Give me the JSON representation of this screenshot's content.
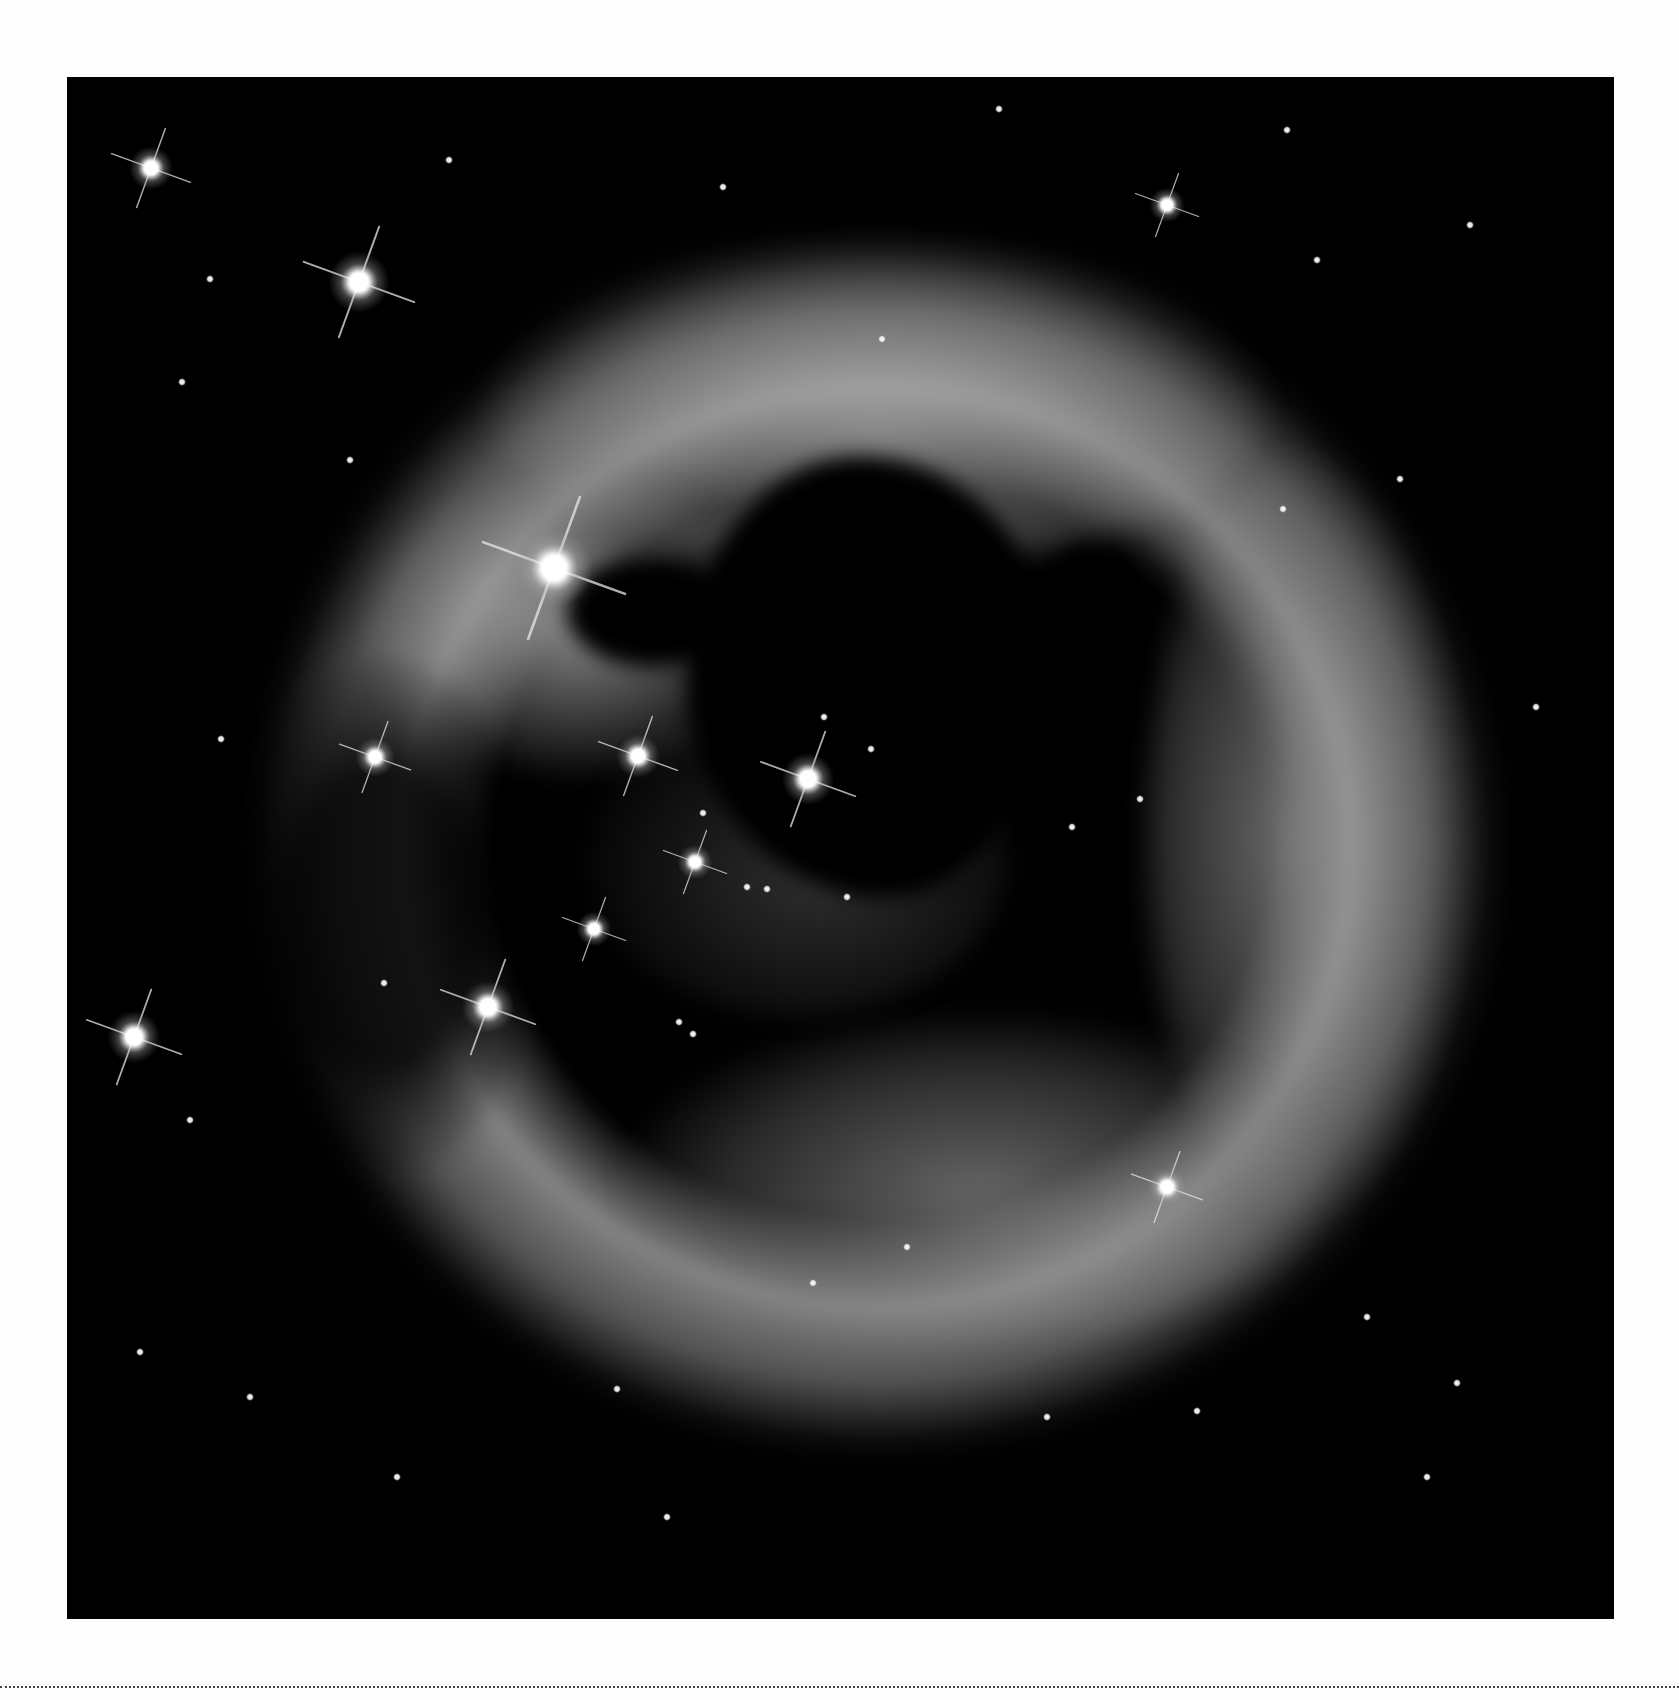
{
  "page": {
    "background_color": "#fdfdfd",
    "photo_background": "#000000",
    "rule_style": "dotted",
    "rule_color": "#444444"
  },
  "photo": {
    "subject": "light-echo nebula around a central star",
    "palette": "grayscale",
    "bright_stars": [
      {
        "x": 84,
        "y": 91,
        "r": 10
      },
      {
        "x": 292,
        "y": 205,
        "r": 14
      },
      {
        "x": 1100,
        "y": 128,
        "r": 8
      },
      {
        "x": 487,
        "y": 491,
        "r": 18
      },
      {
        "x": 571,
        "y": 679,
        "r": 10
      },
      {
        "x": 741,
        "y": 702,
        "r": 12
      },
      {
        "x": 308,
        "y": 680,
        "r": 9
      },
      {
        "x": 628,
        "y": 785,
        "r": 8
      },
      {
        "x": 527,
        "y": 852,
        "r": 8
      },
      {
        "x": 421,
        "y": 930,
        "r": 12
      },
      {
        "x": 67,
        "y": 960,
        "r": 12
      },
      {
        "x": 1100,
        "y": 1110,
        "r": 9
      }
    ],
    "faint_stars": [
      {
        "x": 143,
        "y": 202
      },
      {
        "x": 382,
        "y": 83
      },
      {
        "x": 656,
        "y": 110
      },
      {
        "x": 932,
        "y": 32
      },
      {
        "x": 1220,
        "y": 53
      },
      {
        "x": 1250,
        "y": 183
      },
      {
        "x": 1403,
        "y": 148
      },
      {
        "x": 115,
        "y": 305
      },
      {
        "x": 283,
        "y": 383
      },
      {
        "x": 815,
        "y": 262
      },
      {
        "x": 1216,
        "y": 432
      },
      {
        "x": 1333,
        "y": 402
      },
      {
        "x": 154,
        "y": 662
      },
      {
        "x": 757,
        "y": 640
      },
      {
        "x": 804,
        "y": 672
      },
      {
        "x": 636,
        "y": 736
      },
      {
        "x": 1073,
        "y": 722
      },
      {
        "x": 1005,
        "y": 750
      },
      {
        "x": 680,
        "y": 810
      },
      {
        "x": 700,
        "y": 812
      },
      {
        "x": 780,
        "y": 820
      },
      {
        "x": 317,
        "y": 906
      },
      {
        "x": 626,
        "y": 957
      },
      {
        "x": 612,
        "y": 945
      },
      {
        "x": 123,
        "y": 1043
      },
      {
        "x": 1469,
        "y": 630
      },
      {
        "x": 840,
        "y": 1170
      },
      {
        "x": 746,
        "y": 1206
      },
      {
        "x": 73,
        "y": 1275
      },
      {
        "x": 183,
        "y": 1320
      },
      {
        "x": 550,
        "y": 1312
      },
      {
        "x": 1390,
        "y": 1306
      },
      {
        "x": 1300,
        "y": 1240
      },
      {
        "x": 1130,
        "y": 1334
      },
      {
        "x": 980,
        "y": 1340
      },
      {
        "x": 330,
        "y": 1400
      },
      {
        "x": 600,
        "y": 1440
      },
      {
        "x": 1360,
        "y": 1400
      }
    ]
  }
}
